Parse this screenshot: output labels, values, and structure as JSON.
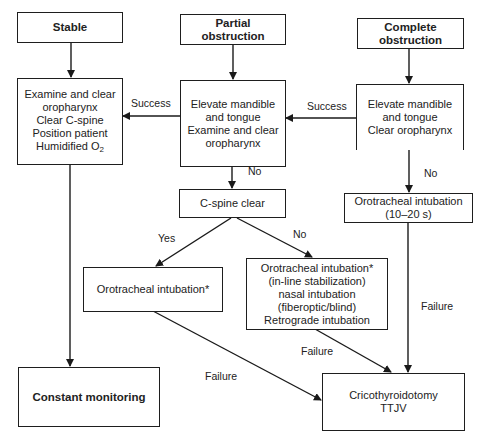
{
  "diagram": {
    "nodes": {
      "stable": {
        "lines": [
          "Stable"
        ]
      },
      "partial": {
        "lines": [
          "Partial",
          "obstruction"
        ]
      },
      "complete": {
        "lines": [
          "Complete",
          "obstruction"
        ]
      },
      "examine": {
        "lines": [
          "Examine and clear",
          "oropharynx",
          "Clear C-spine",
          "Position patient",
          "Humidified O"
        ],
        "subscript": "2"
      },
      "elevate_partial": {
        "lines": [
          "Elevate mandible",
          "and tongue",
          "Examine and clear",
          "oropharynx"
        ]
      },
      "elevate_complete": {
        "lines": [
          "Elevate mandible",
          "and tongue",
          "Clear oropharynx"
        ]
      },
      "cspine": {
        "lines": [
          "C-spine clear"
        ]
      },
      "oro_timed": {
        "lines": [
          "Orotracheal intubation",
          "(10–20 s)"
        ]
      },
      "oro_simple": {
        "lines": [
          "Orotracheal intubation*"
        ]
      },
      "oro_options": {
        "lines": [
          "Orotracheal intubation*",
          "(in-line stabilization)",
          "nasal intubation",
          "(fiberoptic/blind)",
          "Retrograde intubation"
        ]
      },
      "monitoring": {
        "lines": [
          "Constant monitoring"
        ]
      },
      "crico": {
        "lines": [
          "Cricothyroidotomy",
          "TTJV"
        ]
      }
    },
    "edge_labels": {
      "success_left": "Success",
      "success_right": "Success",
      "no_partial": "No",
      "no_complete": "No",
      "yes_cspine": "Yes",
      "no_cspine": "No",
      "failure_timed": "Failure",
      "failure_options": "Failure",
      "failure_simple": "Failure"
    },
    "edges": [
      {
        "from": "stable",
        "to": "examine"
      },
      {
        "from": "partial",
        "to": "elevate_partial"
      },
      {
        "from": "complete",
        "to": "elevate_complete"
      },
      {
        "from": "elevate_partial",
        "to": "examine",
        "label": "Success"
      },
      {
        "from": "elevate_complete",
        "to": "elevate_partial",
        "label": "Success"
      },
      {
        "from": "elevate_partial",
        "to": "cspine",
        "label": "No"
      },
      {
        "from": "elevate_complete",
        "to": "oro_timed",
        "label": "No"
      },
      {
        "from": "cspine",
        "to": "oro_simple",
        "label": "Yes"
      },
      {
        "from": "cspine",
        "to": "oro_options",
        "label": "No"
      },
      {
        "from": "examine",
        "to": "monitoring"
      },
      {
        "from": "oro_simple",
        "to": "crico",
        "label": "Failure"
      },
      {
        "from": "oro_options",
        "to": "crico",
        "label": "Failure"
      },
      {
        "from": "oro_timed",
        "to": "crico",
        "label": "Failure"
      }
    ]
  }
}
